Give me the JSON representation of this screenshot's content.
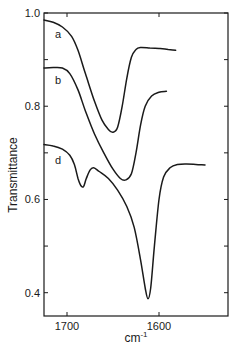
{
  "chart_data": {
    "type": "line",
    "title": "",
    "xlabel": "cm-1",
    "xlabel_base": "cm",
    "xlabel_sup": "-1",
    "ylabel": "Transmittance",
    "xlim": [
      1725,
      1525
    ],
    "ylim": [
      0.35,
      1.0
    ],
    "x_reversed": true,
    "grid": false,
    "legend_position": "inline labels",
    "x_ticks": [
      {
        "value": 1700,
        "label": "1700"
      },
      {
        "value": 1600,
        "label": "1600"
      }
    ],
    "y_ticks": [
      {
        "value": 1.0,
        "label": "1.0"
      },
      {
        "value": 0.9,
        "label": ""
      },
      {
        "value": 0.8,
        "label": "0.8"
      },
      {
        "value": 0.7,
        "label": ""
      },
      {
        "value": 0.6,
        "label": "0.6"
      },
      {
        "value": 0.5,
        "label": ""
      },
      {
        "value": 0.4,
        "label": "0.4"
      }
    ],
    "series": [
      {
        "name": "a",
        "label_pos": {
          "x": 1713,
          "y": 0.955
        },
        "points": [
          [
            1725,
            0.985
          ],
          [
            1715,
            0.98
          ],
          [
            1705,
            0.97
          ],
          [
            1695,
            0.95
          ],
          [
            1688,
            0.92
          ],
          [
            1680,
            0.87
          ],
          [
            1670,
            0.81
          ],
          [
            1662,
            0.77
          ],
          [
            1655,
            0.75
          ],
          [
            1650,
            0.744
          ],
          [
            1645,
            0.755
          ],
          [
            1640,
            0.8
          ],
          [
            1635,
            0.86
          ],
          [
            1630,
            0.905
          ],
          [
            1625,
            0.922
          ],
          [
            1620,
            0.926
          ],
          [
            1610,
            0.925
          ],
          [
            1600,
            0.924
          ],
          [
            1590,
            0.922
          ],
          [
            1582,
            0.92
          ]
        ]
      },
      {
        "name": "b",
        "label_pos": {
          "x": 1713,
          "y": 0.857
        },
        "points": [
          [
            1725,
            0.882
          ],
          [
            1715,
            0.883
          ],
          [
            1705,
            0.882
          ],
          [
            1697,
            0.87
          ],
          [
            1688,
            0.835
          ],
          [
            1680,
            0.79
          ],
          [
            1670,
            0.74
          ],
          [
            1660,
            0.7
          ],
          [
            1650,
            0.665
          ],
          [
            1642,
            0.645
          ],
          [
            1636,
            0.642
          ],
          [
            1630,
            0.655
          ],
          [
            1625,
            0.7
          ],
          [
            1620,
            0.76
          ],
          [
            1615,
            0.8
          ],
          [
            1608,
            0.822
          ],
          [
            1600,
            0.83
          ],
          [
            1592,
            0.832
          ]
        ]
      },
      {
        "name": "d",
        "label_pos": {
          "x": 1713,
          "y": 0.685
        },
        "points": [
          [
            1725,
            0.718
          ],
          [
            1715,
            0.715
          ],
          [
            1705,
            0.708
          ],
          [
            1697,
            0.695
          ],
          [
            1692,
            0.675
          ],
          [
            1688,
            0.645
          ],
          [
            1685,
            0.63
          ],
          [
            1682,
            0.628
          ],
          [
            1679,
            0.645
          ],
          [
            1675,
            0.663
          ],
          [
            1671,
            0.668
          ],
          [
            1665,
            0.66
          ],
          [
            1655,
            0.645
          ],
          [
            1645,
            0.62
          ],
          [
            1635,
            0.585
          ],
          [
            1627,
            0.54
          ],
          [
            1620,
            0.47
          ],
          [
            1615,
            0.41
          ],
          [
            1612,
            0.387
          ],
          [
            1609,
            0.41
          ],
          [
            1605,
            0.5
          ],
          [
            1600,
            0.6
          ],
          [
            1595,
            0.648
          ],
          [
            1588,
            0.668
          ],
          [
            1580,
            0.675
          ],
          [
            1570,
            0.676
          ],
          [
            1560,
            0.675
          ],
          [
            1550,
            0.674
          ]
        ]
      }
    ]
  }
}
